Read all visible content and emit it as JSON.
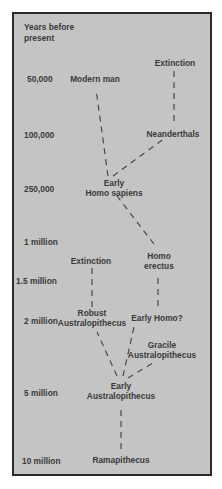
{
  "diagram": {
    "axis_title": "Years before\npresent",
    "timeline": [
      {
        "label": "50,000",
        "y": 78
      },
      {
        "label": "100,000",
        "y": 131
      },
      {
        "label": "250,000",
        "y": 185
      },
      {
        "label": "1 million",
        "y": 239
      },
      {
        "label": "1.5 million",
        "y": 275
      },
      {
        "label": "2 million",
        "y": 316
      },
      {
        "label": "5 million",
        "y": 389
      },
      {
        "label": "10 million",
        "y": 456
      }
    ],
    "nodes": {
      "extinction_top": "Extinction",
      "modern_man": "Modern man",
      "neanderthals": "Neanderthals",
      "early_homo_sapiens": "Early\nHomo sapiens",
      "extinction_mid": "Extinction",
      "homo_erectus": "Homo\nerectus",
      "robust_australopithecus": "Robust\nAustralopithecus",
      "early_homo": "Early Homo?",
      "gracile_australopithecus": "Gracile\nAustralopithecus",
      "early_australopithecus": "Early\nAustralopithecus",
      "ramapithecus": "Ramapithecus"
    },
    "edges": [
      [
        "ramapithecus",
        "early_australopithecus"
      ],
      [
        "early_australopithecus",
        "robust_australopithecus"
      ],
      [
        "early_australopithecus",
        "early_homo"
      ],
      [
        "early_australopithecus",
        "gracile_australopithecus"
      ],
      [
        "robust_australopithecus",
        "extinction_mid"
      ],
      [
        "early_homo",
        "homo_erectus"
      ],
      [
        "homo_erectus",
        "early_homo_sapiens"
      ],
      [
        "early_homo_sapiens",
        "modern_man"
      ],
      [
        "early_homo_sapiens",
        "neanderthals"
      ],
      [
        "neanderthals",
        "extinction_top"
      ]
    ],
    "colors": {
      "panel_bg": "#c4c4c4",
      "border": "#2a2a2a",
      "text": "#3a3a3a",
      "line": "#4a4a4a"
    }
  }
}
